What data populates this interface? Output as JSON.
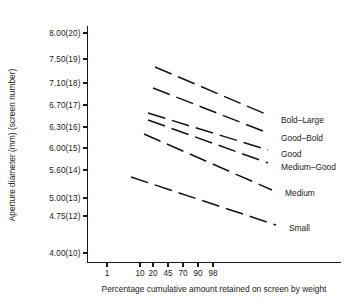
{
  "chart_data": {
    "type": "line",
    "title": "",
    "xlabel": "Percentage cumulative amount retained on screen by weight",
    "ylabel": "Aperture diameter (mm) (screen number)",
    "grid": false,
    "legend_position": "right-inline",
    "line_style": "dashed",
    "x_scale": "probability",
    "x_ticks": [
      {
        "label": "1",
        "px": 107
      },
      {
        "label": "10",
        "px": 140
      },
      {
        "label": "20",
        "px": 153
      },
      {
        "label": "45",
        "px": 168
      },
      {
        "label": "70",
        "px": 183
      },
      {
        "label": "90",
        "px": 198
      },
      {
        "label": "98",
        "px": 213
      }
    ],
    "y_ticks": [
      {
        "label": "8.00(20)",
        "value": 8.0,
        "screen": 20,
        "px": 33
      },
      {
        "label": "7.50(19)",
        "value": 7.5,
        "screen": 19,
        "px": 59
      },
      {
        "label": "7.10(18)",
        "value": 7.1,
        "screen": 18,
        "px": 83
      },
      {
        "label": "6.70(17)",
        "value": 6.7,
        "screen": 17,
        "px": 105
      },
      {
        "label": "6.30(16)",
        "value": 6.3,
        "screen": 16,
        "px": 127
      },
      {
        "label": "6.00(15)",
        "value": 6.0,
        "screen": 15,
        "px": 148
      },
      {
        "label": "5.60(14)",
        "value": 5.6,
        "screen": 14,
        "px": 170
      },
      {
        "label": "5.00(13)",
        "value": 5.0,
        "screen": 13,
        "px": 198
      },
      {
        "label": "4.75(12)",
        "value": 4.75,
        "screen": 12,
        "px": 216
      },
      {
        "label": "4.00(10)",
        "value": 4.0,
        "screen": 10,
        "px": 253
      }
    ],
    "series": [
      {
        "name": "Bold-Large",
        "label": "Bold–Large",
        "label_px": {
          "x": 281,
          "y": 120
        },
        "start_px": {
          "x": 155,
          "y": 67
        },
        "end_px": {
          "x": 268,
          "y": 115
        }
      },
      {
        "name": "Good-Bold",
        "label": "Good–Bold",
        "label_px": {
          "x": 281,
          "y": 138
        },
        "start_px": {
          "x": 153,
          "y": 88
        },
        "end_px": {
          "x": 268,
          "y": 133
        }
      },
      {
        "name": "Good",
        "label": "Good",
        "label_px": {
          "x": 281,
          "y": 154
        },
        "start_px": {
          "x": 148,
          "y": 113
        },
        "end_px": {
          "x": 268,
          "y": 150
        }
      },
      {
        "name": "Medium-Good",
        "label": "Medium–Good",
        "label_px": {
          "x": 281,
          "y": 167
        },
        "start_px": {
          "x": 148,
          "y": 120
        },
        "end_px": {
          "x": 268,
          "y": 163
        }
      },
      {
        "name": "Medium",
        "label": "Medium",
        "label_px": {
          "x": 285,
          "y": 193
        },
        "start_px": {
          "x": 144,
          "y": 134
        },
        "end_px": {
          "x": 272,
          "y": 190
        }
      },
      {
        "name": "Small",
        "label": "Small",
        "label_px": {
          "x": 289,
          "y": 228
        },
        "start_px": {
          "x": 131,
          "y": 177
        },
        "end_px": {
          "x": 276,
          "y": 225
        }
      }
    ]
  }
}
